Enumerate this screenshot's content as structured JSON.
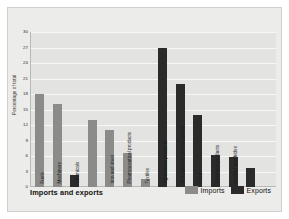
{
  "chart_data": {
    "type": "bar",
    "title": "Imports and exports",
    "xlabel": "",
    "ylabel": "Percentage of total",
    "ylim": [
      0,
      30
    ],
    "ytick_values": [
      30,
      27,
      24,
      21,
      18,
      15,
      12,
      9,
      6,
      3,
      0
    ],
    "grid": true,
    "legend_position": "bottom-right",
    "legend": [
      "Imports",
      "Exports"
    ],
    "categories": [
      "Fuels",
      "Machinery",
      "Chemicals",
      "Iron and steel",
      "Pharmaceutical products",
      "Textiles",
      "Agricultural products",
      "Iron and non-ferrous metals",
      "Food",
      "Chemical products",
      "Leather and hides"
    ],
    "series": [
      {
        "name": "Imports",
        "color": "#8b8b89",
        "values": [
          18,
          16,
          13,
          11,
          6.5,
          1.6,
          null,
          null,
          null,
          null,
          null
        ]
      },
      {
        "name": "Exports",
        "color": "#2b2b2b",
        "values": [
          null,
          null,
          2.4,
          null,
          null,
          null,
          27,
          20,
          14,
          6.2,
          5.8
        ]
      }
    ],
    "bars": [
      {
        "category": "Fuels",
        "series": "Imports",
        "value": 18
      },
      {
        "category": "Machinery",
        "series": "Imports",
        "value": 16
      },
      {
        "category": "Chemicals",
        "series": "Exports",
        "value": 2.4
      },
      {
        "category": "Chemicals",
        "series": "Imports",
        "value": 13
      },
      {
        "category": "Iron and steel",
        "series": "Imports",
        "value": 11
      },
      {
        "category": "Pharmaceutical products",
        "series": "Imports",
        "value": 6.5
      },
      {
        "category": "Textiles",
        "series": "Imports",
        "value": 1.6
      },
      {
        "category": "Agricultural products",
        "series": "Exports",
        "value": 27
      },
      {
        "category": "Iron and non-ferrous metals",
        "series": "Exports",
        "value": 20
      },
      {
        "category": "Food",
        "series": "Exports",
        "value": 14
      },
      {
        "category": "Chemical products",
        "series": "Exports",
        "value": 6.2
      },
      {
        "category": "Leather and hides",
        "series": "Exports",
        "value": 5.8
      },
      {
        "category": "Leather and hides",
        "series": "Exports",
        "value": 3.6
      }
    ],
    "colors": {
      "imports": "#8b8b89",
      "exports": "#2b2b2b",
      "panel": "#ececeb",
      "plot": "#e3e3e1",
      "gridline": "#f7f7f6"
    }
  }
}
